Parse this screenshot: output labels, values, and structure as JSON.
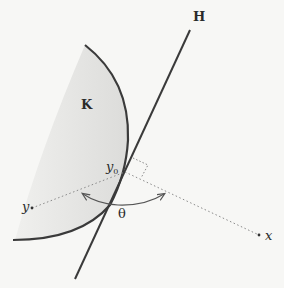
{
  "figure": {
    "labels": {
      "hyperplane": "H",
      "set": "K",
      "tangent_point": "y",
      "tangent_point_subscript": "0",
      "point_y": "y",
      "point_x": "x",
      "angle": "θ"
    },
    "colors": {
      "background": "#f7f7f5",
      "stroke": "#3a3a3a",
      "fill": "#e4e4e2",
      "dotted": "#8a8a8a"
    }
  }
}
